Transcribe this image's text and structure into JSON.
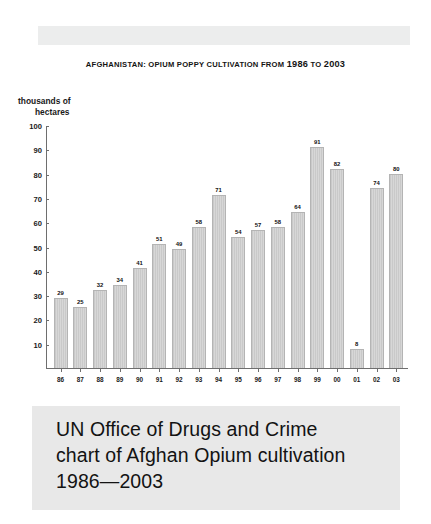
{
  "page": {
    "background_color": "#ffffff",
    "band_color": "#eceded"
  },
  "chart": {
    "title_prefix": "A",
    "title": "FGHANISTAN: OPIUM POPPY CULTIVATION FROM ",
    "title_full": "AFGHANISTAN: OPIUM POPPY CULTIVATION FROM 1986 TO 2003",
    "y_axis_label_line1": "thousands of",
    "y_axis_label_line2": "hectares",
    "bar_fill_color": "#d2d2d2",
    "bar_border_color": "#b4b4b4",
    "axis_color": "#6e6e6e"
  },
  "caption": {
    "line1": "UN Office of Drugs and Crime",
    "line2": "chart of Afghan Opium cultivation",
    "line3": "1986—2003",
    "background_color": "#e8e8e8"
  },
  "chart_data": {
    "type": "bar",
    "title": "AFGHANISTAN: OPIUM POPPY CULTIVATION FROM 1986 TO 2003",
    "xlabel": "",
    "ylabel": "thousands of hectares",
    "ylim": [
      0,
      100
    ],
    "yticks": [
      10,
      20,
      30,
      40,
      50,
      60,
      70,
      80,
      90,
      100
    ],
    "grid": false,
    "legend": false,
    "categories": [
      "86",
      "87",
      "88",
      "89",
      "90",
      "91",
      "92",
      "93",
      "94",
      "95",
      "96",
      "97",
      "98",
      "99",
      "00",
      "01",
      "02",
      "03"
    ],
    "values": [
      29,
      25,
      32,
      34,
      41,
      51,
      49,
      58,
      71,
      54,
      57,
      58,
      64,
      91,
      82,
      8,
      74,
      80
    ],
    "data_labels": [
      "29",
      "25",
      "32",
      "34",
      "41",
      "51",
      "49",
      "58",
      "71",
      "54",
      "57",
      "58",
      "64",
      "91",
      "82",
      "8",
      "74",
      "80"
    ]
  }
}
